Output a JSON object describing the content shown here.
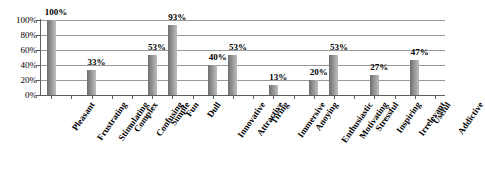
{
  "chart_data": {
    "type": "bar",
    "title": "",
    "subtitle": "",
    "xlabel": "",
    "ylabel": "",
    "ylim": [
      0,
      100
    ],
    "grid": true,
    "legend": false,
    "legend_position": "none",
    "y_ticks": [
      "0%",
      "20%",
      "40%",
      "60%",
      "80%",
      "100%"
    ],
    "y_tick_values": [
      0,
      20,
      40,
      60,
      80,
      100
    ],
    "categories": [
      "Pleasant",
      "Frustrating",
      "Stimulating",
      "Complex",
      "Confusing",
      "Simple",
      "Fun",
      "Dull",
      "Innovative",
      "Attractive",
      "Tiring",
      "Immersive",
      "Anoying",
      "Enthusiastic",
      "Motivating",
      "Stressful",
      "Inspiring",
      "Irrelevant",
      "Useful",
      "Addictive"
    ],
    "values": [
      100,
      0,
      33,
      0,
      0,
      53,
      93,
      0,
      40,
      53,
      0,
      13,
      0,
      20,
      53,
      0,
      27,
      0,
      47,
      0
    ],
    "data_labels": [
      "100%",
      "",
      "33%",
      "",
      "",
      "53%",
      "93%",
      "",
      "40%",
      "53%",
      "",
      "13%",
      "",
      "20%",
      "53%",
      "",
      "27%",
      "",
      "47%",
      ""
    ]
  },
  "colors": {
    "bar_dark": "#6e6e6e",
    "bar_light": "#bdbdbd",
    "gridline": "#9a9a9a",
    "axis": "#5d5d5d",
    "text": "#000000",
    "background": "#ffffff"
  }
}
